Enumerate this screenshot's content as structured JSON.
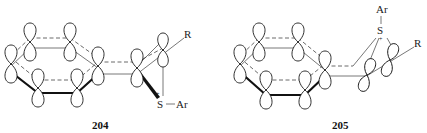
{
  "figure": {
    "structures": [
      {
        "id": "204",
        "label": "204",
        "substituents": {
          "r_label": "R",
          "sulfur_label": "S",
          "aryl_label": "Ar",
          "charge": "+"
        },
        "sulfur_position": "below (anti), bold wedge to S"
      },
      {
        "id": "205",
        "label": "205",
        "substituents": {
          "r_label": "R",
          "sulfur_label": "S",
          "aryl_label": "Ar",
          "charge": "+"
        },
        "sulfur_position": "above, bridging the vinyl carbons"
      }
    ]
  }
}
